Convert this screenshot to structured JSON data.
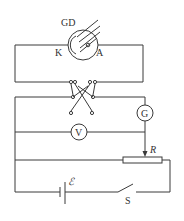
{
  "diagram": {
    "type": "circuit",
    "components": {
      "photocell": {
        "label": "GD",
        "cathode_label": "K",
        "anode_label": "A"
      },
      "galvanometer": {
        "label": "G"
      },
      "voltmeter": {
        "label": "V"
      },
      "rheostat": {
        "label": "R"
      },
      "battery": {
        "label": "ℰ"
      },
      "switch": {
        "label": "S"
      },
      "reversing_switch": {
        "label": ""
      }
    }
  }
}
